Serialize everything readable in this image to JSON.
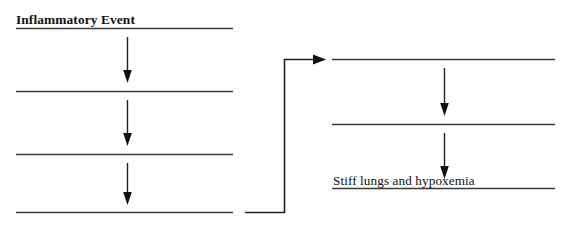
{
  "diagram": {
    "type": "fill-in-the-blank flowchart",
    "orientation": "two columns linked left-to-right",
    "line_color": "#3a3a3a",
    "arrow_color": "#101010",
    "background_color": "#ffffff",
    "left_column": {
      "steps": [
        {
          "id": "step-1",
          "label": "Inflammatory Event",
          "filled": true,
          "style": "bold-underlined"
        },
        {
          "id": "step-2",
          "label": "",
          "filled": false,
          "style": "blank-underline"
        },
        {
          "id": "step-3",
          "label": "",
          "filled": false,
          "style": "blank-underline"
        },
        {
          "id": "step-4",
          "label": "",
          "filled": false,
          "style": "blank-underline"
        }
      ],
      "arrow_count": 3,
      "arrow_direction": "down"
    },
    "connector": {
      "id": "connector-elbow",
      "direction": "right",
      "shape": "elbow",
      "from": "left-column-step-4",
      "to": "right-column-step-1"
    },
    "right_column": {
      "steps": [
        {
          "id": "step-5",
          "label": "",
          "filled": false,
          "style": "blank-underline"
        },
        {
          "id": "step-6",
          "label": "",
          "filled": false,
          "style": "blank-underline"
        },
        {
          "id": "step-7",
          "label": "Stiff lungs and hypoxemia",
          "filled": true,
          "style": "plain-underlined"
        }
      ],
      "arrow_count": 2,
      "arrow_direction": "down"
    }
  }
}
